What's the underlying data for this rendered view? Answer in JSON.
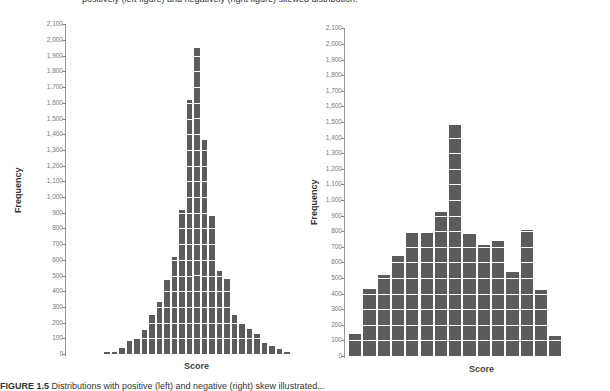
{
  "captions": {
    "top": "positively (left figure) and negatively (right figure) skewed distribution.",
    "bottom_label": "FIGURE 1.5",
    "bottom_text": "Distributions with positive (left) and negative (right) skew illustrated..."
  },
  "colors": {
    "bar": "#5b5b5b",
    "gridline": "#ffffff",
    "axis": "#999999"
  },
  "chart_data": [
    {
      "type": "bar",
      "title": "",
      "xlabel": "Score",
      "ylabel": "Frequency",
      "ylim": [
        0,
        2100
      ],
      "yticks": [
        "0",
        "100",
        "200",
        "300",
        "400",
        "500",
        "600",
        "700",
        "800",
        "900",
        "1,000",
        "1,100",
        "1,200",
        "1,300",
        "1,400",
        "1,500",
        "1,600",
        "1,700",
        "1,800",
        "1,900",
        "2,000",
        "2,100"
      ],
      "categories": [
        "1",
        "2",
        "3",
        "4",
        "5",
        "6",
        "7",
        "8",
        "9",
        "10",
        "11",
        "12",
        "13",
        "14",
        "15",
        "16",
        "17",
        "18",
        "19",
        "20",
        "21",
        "22",
        "23",
        "24",
        "25"
      ],
      "values": [
        10,
        10,
        40,
        80,
        100,
        150,
        250,
        330,
        470,
        620,
        920,
        1620,
        1950,
        1360,
        880,
        530,
        480,
        250,
        200,
        160,
        130,
        70,
        50,
        30,
        10
      ],
      "grid": false
    },
    {
      "type": "bar",
      "title": "",
      "xlabel": "Score",
      "ylabel": "Frequency",
      "ylim": [
        0,
        2100
      ],
      "yticks": [
        "0",
        "100",
        "200",
        "300",
        "400",
        "500",
        "600",
        "700",
        "800",
        "900",
        "1,000",
        "1,100",
        "1,200",
        "1,300",
        "1,400",
        "1,500",
        "1,600",
        "1,700",
        "1,800",
        "1,900",
        "2,000",
        "2,100"
      ],
      "categories": [
        "1",
        "2",
        "3",
        "4",
        "5",
        "6",
        "7",
        "8",
        "9",
        "10",
        "11",
        "12",
        "13",
        "14",
        "15"
      ],
      "values": [
        140,
        430,
        520,
        640,
        790,
        790,
        920,
        1480,
        780,
        710,
        740,
        540,
        810,
        420,
        130
      ],
      "grid": false
    }
  ]
}
